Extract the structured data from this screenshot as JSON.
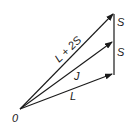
{
  "diagram": {
    "type": "vector-addition",
    "origin_label": "0",
    "vectors": [
      {
        "id": "L",
        "label": "L"
      },
      {
        "id": "J",
        "label": "J"
      },
      {
        "id": "L2S",
        "label": "L + 2S"
      }
    ],
    "segments": [
      {
        "id": "S-lower",
        "label": "S"
      },
      {
        "id": "S-upper",
        "label": "S"
      }
    ],
    "colors": {
      "stroke": "#1a1a1a",
      "background": "#ffffff"
    }
  }
}
